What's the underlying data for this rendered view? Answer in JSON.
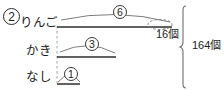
{
  "problem": {
    "number": "2"
  },
  "diagram": {
    "type": "tape-diagram",
    "rows": [
      {
        "id": "ringo",
        "label": "りんご",
        "multiplier": "6",
        "bar_units": 6
      },
      {
        "id": "kaki",
        "label": "かき",
        "multiplier": "3",
        "bar_units": 3
      },
      {
        "id": "nashi",
        "label": "なし",
        "multiplier": "1",
        "bar_units": 1
      }
    ],
    "annotations": {
      "segment_value": "16個",
      "total_value": "164個"
    },
    "colors": {
      "ink": "#222222",
      "line": "#3a3a3a",
      "guide": "#8c8c8c",
      "background": "#ffffff"
    }
  }
}
